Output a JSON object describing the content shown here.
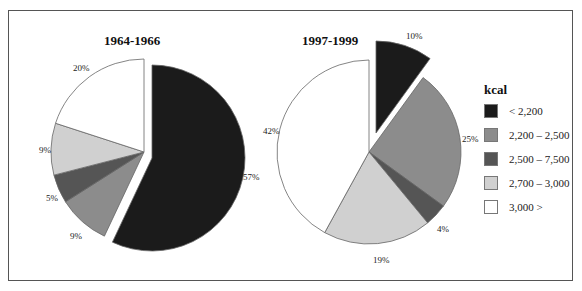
{
  "chart_data": [
    {
      "type": "pie",
      "title": "1964-1966",
      "categories": [
        "< 2,200",
        "2,200 – 2,500",
        "2,500 – 7,500",
        "2,700 – 3,000",
        "3,000 >"
      ],
      "values": [
        57,
        9,
        5,
        9,
        20
      ],
      "labels": [
        "57%",
        "9%",
        "5%",
        "9%",
        "20%"
      ],
      "exploded": "< 2,200",
      "start_angle": "12 o'clock, clockwise"
    },
    {
      "type": "pie",
      "title": "1997-1999",
      "categories": [
        "< 2,200",
        "2,200 – 2,500",
        "2,500 – 7,500",
        "2,700 – 3,000",
        "3,000 >"
      ],
      "values": [
        10,
        25,
        4,
        19,
        42
      ],
      "labels": [
        "10%",
        "25%",
        "4%",
        "19%",
        "42%"
      ],
      "exploded": "< 2,200",
      "start_angle": "12 o'clock, clockwise"
    }
  ],
  "legend": {
    "title": "kcal",
    "position": "right",
    "items": [
      {
        "label": "< 2,200",
        "color": "#1b1b1b"
      },
      {
        "label": "2,200 – 2,500",
        "color": "#8c8c8c"
      },
      {
        "label": "2,500 – 7,500",
        "color": "#555555"
      },
      {
        "label": "2,700 – 3,000",
        "color": "#d0d0d0"
      },
      {
        "label": "3,000 >",
        "color": "#ffffff"
      }
    ]
  },
  "pies": {
    "left": {
      "title": "1964-1966",
      "labels": {
        "s0": "57%",
        "s1": "9%",
        "s2": "5%",
        "s3": "9%",
        "s4": "20%"
      }
    },
    "right": {
      "title": "1997-1999",
      "labels": {
        "s0": "10%",
        "s1": "25%",
        "s2": "4%",
        "s3": "19%",
        "s4": "42%"
      }
    }
  }
}
